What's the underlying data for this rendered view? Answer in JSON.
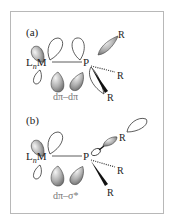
{
  "figure": {
    "panels": [
      {
        "label": "(a)",
        "metal": "L",
        "metal_sub": "n",
        "metal_sym": "M",
        "phosphorus": "P",
        "substituents": [
          "R",
          "R",
          "R"
        ],
        "caption": "dπ–dπ",
        "interaction": "metal d orbital overlap with phosphorus d orbital"
      },
      {
        "label": "(b)",
        "metal": "L",
        "metal_sub": "n",
        "metal_sym": "M",
        "phosphorus": "P",
        "substituents": [
          "R",
          "R",
          "R"
        ],
        "caption": "dπ–σ*",
        "interaction": "metal d orbital overlap with P–R σ* orbital"
      }
    ],
    "colors": {
      "frame": "#b8b8b8",
      "text": "#222222",
      "caption": "#777777",
      "lobe_dark": "#7a7a7a",
      "lobe_light": "#e8e8e8",
      "outline": "#333333"
    }
  }
}
